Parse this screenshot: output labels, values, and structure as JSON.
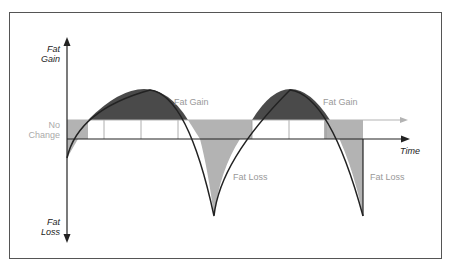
{
  "diagram": {
    "y_axis": {
      "top_label_line1": "Fat",
      "top_label_line2": "Gain",
      "bottom_label_line1": "Fat",
      "bottom_label_line2": "Loss",
      "mid_label_line1": "No",
      "mid_label_line2": "Change"
    },
    "x_axis": {
      "label": "Time"
    },
    "regions": {
      "gain_1": "Fat Gain",
      "gain_2": "Fat Gain",
      "loss_1": "Fat Loss",
      "loss_2": "Fat Loss"
    },
    "colors": {
      "gain_fill": "#4a4a4a",
      "loss_fill": "#b3b3b3",
      "band_fill": "#b3b3b3",
      "curve": "#222222",
      "axis": "#222222",
      "frame": "#555555"
    }
  }
}
